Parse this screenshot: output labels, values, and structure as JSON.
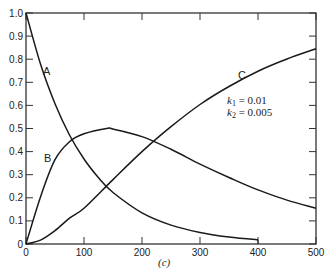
{
  "chart_data": {
    "type": "line",
    "title": "",
    "caption": "(c)",
    "xlabel": "",
    "ylabel": "",
    "xlim": [
      0,
      500
    ],
    "ylim": [
      0,
      1.0
    ],
    "x_ticks": [
      0,
      100,
      200,
      300,
      400,
      500
    ],
    "y_ticks": [
      0,
      0.1,
      0.2,
      0.3,
      0.4,
      0.5,
      0.6,
      0.7,
      0.8,
      0.9,
      1.0
    ],
    "y_tick_labels": [
      "0",
      "0.1",
      "0.2",
      "0.3",
      "0.4",
      "0.5",
      "0.6",
      "0.7",
      "0.8",
      "0.9",
      "1.0"
    ],
    "x_tick_labels": [
      "0",
      "100",
      "200",
      "300",
      "400",
      "500"
    ],
    "grid": false,
    "frame": "box with inward ticks on all sides",
    "annotations": [
      {
        "text": "k1 = 0.01",
        "sub": "1",
        "value": "0.01"
      },
      {
        "text": "k2 = 0.005",
        "sub": "2",
        "value": "0.005"
      }
    ],
    "series": [
      {
        "name": "A",
        "label_at": [
          40,
          0.72
        ],
        "x_max": 400,
        "x": [
          0,
          25,
          50,
          75,
          100,
          125,
          150,
          200,
          250,
          300,
          350,
          400
        ],
        "values": [
          1.0,
          0.779,
          0.607,
          0.472,
          0.368,
          0.287,
          0.223,
          0.135,
          0.082,
          0.05,
          0.03,
          0.018
        ]
      },
      {
        "name": "B",
        "label_at": [
          50,
          0.3
        ],
        "x_max": 500,
        "x": [
          0,
          25,
          50,
          75,
          100,
          139,
          150,
          200,
          250,
          300,
          350,
          400,
          450,
          500
        ],
        "values": [
          0,
          0.204,
          0.365,
          0.443,
          0.477,
          0.5,
          0.498,
          0.465,
          0.41,
          0.346,
          0.288,
          0.234,
          0.19,
          0.155
        ]
      },
      {
        "name": "C",
        "label_at": [
          290,
          0.75
        ],
        "x_max": 500,
        "x": [
          0,
          25,
          50,
          75,
          100,
          150,
          200,
          250,
          300,
          350,
          400,
          450,
          500
        ],
        "values": [
          0,
          0.017,
          0.058,
          0.112,
          0.155,
          0.279,
          0.4,
          0.508,
          0.604,
          0.682,
          0.748,
          0.801,
          0.845
        ]
      }
    ]
  },
  "labels": {
    "curve_a": "A",
    "curve_b": "B",
    "curve_c": "C",
    "k1_prefix": "k",
    "k1_sub": "1",
    "k1_value": " = 0.01",
    "k2_prefix": "k",
    "k2_sub": "2",
    "k2_value": " = 0.005",
    "caption": "(c)"
  },
  "colors": {
    "line": "#1a1a1a",
    "axis": "#333333",
    "text": "#222222"
  }
}
